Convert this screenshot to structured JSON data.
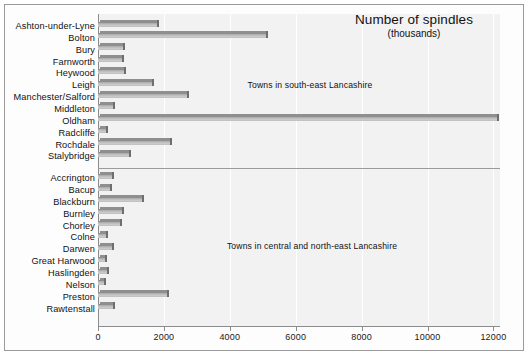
{
  "chart_data": {
    "type": "bar",
    "orientation": "horizontal",
    "title": "Number of spindles",
    "subtitle": "(thousands)",
    "xlabel": "",
    "ylabel": "",
    "xlim": [
      0,
      12200
    ],
    "xticks": [
      0,
      2000,
      4000,
      6000,
      8000,
      10000,
      12000
    ],
    "xtick_labels": [
      "0",
      "2000",
      "4000",
      "6000",
      "8000",
      "10000",
      "12000"
    ],
    "grid": "vertical",
    "legend": "none",
    "categories": [
      "Ashton-under-Lyne",
      "Bolton",
      "Bury",
      "Farnworth",
      "Heywood",
      "Leigh",
      "Manchester/Salford",
      "Middleton",
      "Oldham",
      "Radcliffe",
      "Rochdale",
      "Stalybridge",
      "Accrington",
      "Bacup",
      "Blackburn",
      "Burnley",
      "Chorley",
      "Colne",
      "Darwen",
      "Great Harwood",
      "Haslingden",
      "Nelson",
      "Preston",
      "Rawtenstall"
    ],
    "values": [
      1800,
      5100,
      750,
      720,
      800,
      1650,
      2700,
      450,
      12100,
      250,
      2200,
      950,
      420,
      360,
      1350,
      720,
      670,
      230,
      420,
      200,
      280,
      170,
      2100,
      450
    ],
    "annotations": [
      "Towns in south-east Lancashire",
      "Towns in central and north-east Lancashire"
    ],
    "groups": [
      {
        "label": "Towns in south-east Lancashire",
        "start": 0,
        "end": 11
      },
      {
        "label": "Towns in central and north-east Lancashire",
        "start": 12,
        "end": 23
      }
    ],
    "colors": {
      "bar": "#bdbdbd",
      "bar_edge": "#6e6e6e",
      "plot_background": "#f2f2f2",
      "grid": "#ffffff",
      "axis": "#8c8c8c",
      "text": "#111111",
      "frame": "#9a9a9a"
    }
  }
}
